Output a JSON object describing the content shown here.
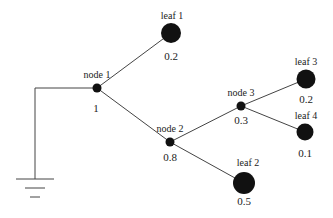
{
  "diagram": {
    "type": "tree",
    "wire_color": "#444444",
    "node_color": "#111111",
    "ground": {
      "symbol": "ground-icon"
    },
    "nodes": [
      {
        "id": "node1",
        "label": "node 1",
        "value": "1"
      },
      {
        "id": "node2",
        "label": "node 2",
        "value": "0.8"
      },
      {
        "id": "node3",
        "label": "node 3",
        "value": "0.3"
      }
    ],
    "leaves": [
      {
        "id": "leaf1",
        "label": "leaf 1",
        "value": "0.2"
      },
      {
        "id": "leaf2",
        "label": "leaf 2",
        "value": "0.5"
      },
      {
        "id": "leaf3",
        "label": "leaf 3",
        "value": "0.2"
      },
      {
        "id": "leaf4",
        "label": "leaf 4",
        "value": "0.1"
      }
    ],
    "edges": [
      [
        "ground",
        "node1"
      ],
      [
        "node1",
        "leaf1"
      ],
      [
        "node1",
        "node2"
      ],
      [
        "node2",
        "node3"
      ],
      [
        "node2",
        "leaf2"
      ],
      [
        "node3",
        "leaf3"
      ],
      [
        "node3",
        "leaf4"
      ]
    ]
  }
}
